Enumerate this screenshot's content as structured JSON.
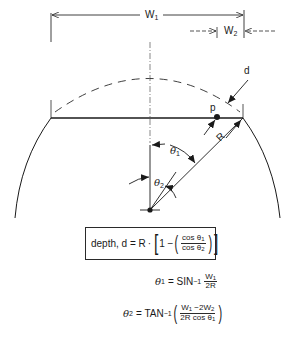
{
  "diagram": {
    "labels": {
      "w1": "W",
      "w1_sub": "1",
      "w2": "W",
      "w2_sub": "2",
      "d": "d",
      "p": "p",
      "r": "R",
      "theta1": "θ",
      "theta1_sub": "1",
      "theta2": "θ",
      "theta2_sub": "2"
    },
    "colors": {
      "line": "#2a2a2a",
      "background": "#ffffff"
    }
  },
  "formulas": {
    "depth": {
      "prefix": "depth, d = R",
      "dot": "·",
      "one_minus": "1 −",
      "num": "cos θ",
      "num_sub": "1",
      "den": "cos θ",
      "den_sub": "2"
    },
    "theta1": {
      "lhs": "θ",
      "lhs_sub": "1",
      "eq": "= SIN",
      "sup": "−1",
      "num": "W",
      "num_sub": "1",
      "den": "2R"
    },
    "theta2": {
      "lhs": "θ",
      "lhs_sub": "2",
      "eq": "= TAN",
      "sup": "−1",
      "num_a": "W",
      "num_a_sub": "1",
      "num_b": " −2W",
      "num_b_sub": "2",
      "den": "2R cos θ",
      "den_sub": "1"
    }
  }
}
